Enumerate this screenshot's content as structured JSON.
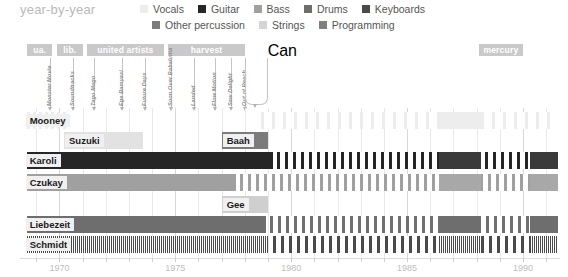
{
  "header": {
    "title": "year-by-year",
    "legend": [
      {
        "label": "Vocals",
        "color": "#ededed"
      },
      {
        "label": "Guitar",
        "color": "#262626"
      },
      {
        "label": "Bass",
        "color": "#a0a0a0"
      },
      {
        "label": "Drums",
        "color": "#6e6e6e"
      },
      {
        "label": "Keyboards",
        "color": "#4a4a4a"
      },
      {
        "label": "Other percussion",
        "color": "#7c7c7c"
      },
      {
        "label": "Strings",
        "color": "#d5d5d5"
      },
      {
        "label": "Programming",
        "color": "#808080"
      }
    ]
  },
  "labels": {
    "bands": [
      {
        "text": "ua.",
        "start": 1968.6,
        "end": 1969.7
      },
      {
        "text": "lib.",
        "start": 1969.9,
        "end": 1971.0
      },
      {
        "text": "united artists",
        "start": 1971.2,
        "end": 1974.5
      },
      {
        "text": "harvest",
        "start": 1974.7,
        "end": 1978.0
      },
      {
        "text": "mercury",
        "start": 1988.1,
        "end": 1990.0
      }
    ]
  },
  "albums": [
    {
      "title": "Monster Movie",
      "year": 1969.6
    },
    {
      "title": "Soundtracks",
      "year": 1970.6
    },
    {
      "title": "Tago Mago",
      "year": 1971.5
    },
    {
      "title": "Ege Bamyasi",
      "year": 1972.7
    },
    {
      "title": "Future Days",
      "year": 1973.7
    },
    {
      "title": "Soon Over Babaluma",
      "year": 1974.8
    },
    {
      "title": "Landed",
      "year": 1975.8
    },
    {
      "title": "Flow Motion",
      "year": 1976.7
    },
    {
      "title": "Saw Delight",
      "year": 1977.4
    },
    {
      "title": "Out of Reach",
      "year": 1978.0
    },
    {
      "title": "Can",
      "year": 1978.9
    }
  ],
  "chart_data": {
    "type": "bar",
    "title": "year-by-year",
    "xlabel": "",
    "ylabel": "",
    "xlim": [
      1968.3,
      1991.6
    ],
    "grid": true,
    "legend_position": "top-right",
    "xticks": [
      1970,
      1975,
      1980,
      1985,
      1990
    ],
    "xticklabels": [
      "1970",
      "1975",
      "1980",
      "1985",
      "1990"
    ],
    "categories": [
      "Mooney",
      "Suzuki",
      "Karoli",
      "Czukay",
      "Baah",
      "Gee",
      "Liebezeit",
      "Schmidt"
    ],
    "rows": [
      {
        "name": "Mooney",
        "label": "Mooney",
        "label_at": 1968.5,
        "label_row": 0,
        "segments": [
          {
            "start": 1968.6,
            "end": 1970.3,
            "color": "#ededed",
            "pattern": "striped",
            "instrument": "Vocals"
          },
          {
            "start": 1978.7,
            "end": 1991.5,
            "color": "#ededed",
            "pattern": "striped-sparse",
            "instrument": "Vocals"
          },
          {
            "start": 1986.4,
            "end": 1988.2,
            "color": "#ededed",
            "pattern": "solid",
            "instrument": "Vocals"
          }
        ]
      },
      {
        "name": "Suzuki",
        "label": "Suzuki",
        "label_at": 1970.2,
        "label_row": 1,
        "segments": [
          {
            "start": 1970.2,
            "end": 1973.6,
            "color": "#e2e2e2",
            "pattern": "solid",
            "instrument": "Vocals"
          }
        ]
      },
      {
        "name": "Baah",
        "label": "Baah",
        "label_at": 1977.0,
        "label_row": 1,
        "segments": [
          {
            "start": 1977.0,
            "end": 1979.0,
            "color": "#7c7c7c",
            "pattern": "solid",
            "instrument": "Other percussion"
          }
        ]
      },
      {
        "name": "Karoli",
        "label": "Karoli",
        "label_at": 1968.5,
        "label_row": 2,
        "segments": [
          {
            "start": 1968.6,
            "end": 1979.2,
            "color": "#262626",
            "pattern": "solid",
            "instrument": "Guitar"
          },
          {
            "start": 1979.4,
            "end": 1991.5,
            "color": "#262626",
            "pattern": "striped-med",
            "instrument": "Guitar"
          },
          {
            "start": 1986.4,
            "end": 1988.2,
            "color": "#3a3a3a",
            "pattern": "solid",
            "instrument": "Guitar"
          },
          {
            "start": 1990.3,
            "end": 1991.5,
            "color": "#3a3a3a",
            "pattern": "solid",
            "instrument": "Guitar"
          }
        ]
      },
      {
        "name": "Czukay",
        "label": "Czukay",
        "label_at": 1968.5,
        "label_row": 3,
        "segments": [
          {
            "start": 1968.6,
            "end": 1977.6,
            "color": "#a0a0a0",
            "pattern": "solid",
            "instrument": "Bass"
          },
          {
            "start": 1977.8,
            "end": 1991.5,
            "color": "#a0a0a0",
            "pattern": "striped-med",
            "instrument": "Bass"
          },
          {
            "start": 1986.4,
            "end": 1988.2,
            "color": "#a8a8a8",
            "pattern": "solid",
            "instrument": "Bass"
          },
          {
            "start": 1990.3,
            "end": 1991.5,
            "color": "#a8a8a8",
            "pattern": "solid",
            "instrument": "Bass"
          }
        ]
      },
      {
        "name": "Gee",
        "label": "Gee",
        "label_at": 1977.0,
        "label_row": 4,
        "segments": [
          {
            "start": 1977.0,
            "end": 1979.0,
            "color": "#cfcfcf",
            "pattern": "solid",
            "instrument": "Strings"
          }
        ]
      },
      {
        "name": "Liebezeit",
        "label": "Liebezeit",
        "label_at": 1968.5,
        "label_row": 5,
        "segments": [
          {
            "start": 1968.6,
            "end": 1978.9,
            "color": "#6e6e6e",
            "pattern": "solid",
            "instrument": "Drums"
          },
          {
            "start": 1979.1,
            "end": 1991.5,
            "color": "#6e6e6e",
            "pattern": "striped-med",
            "instrument": "Drums"
          },
          {
            "start": 1986.4,
            "end": 1988.2,
            "color": "#6e6e6e",
            "pattern": "solid",
            "instrument": "Drums"
          },
          {
            "start": 1990.3,
            "end": 1991.5,
            "color": "#6e6e6e",
            "pattern": "solid",
            "instrument": "Drums"
          }
        ]
      },
      {
        "name": "Schmidt",
        "label": "Schmidt",
        "label_at": 1968.5,
        "label_row": 6,
        "segments": [
          {
            "start": 1968.6,
            "end": 1979.0,
            "color": "#4a4a4a",
            "pattern": "striped-fine",
            "instrument": "Keyboards"
          },
          {
            "start": 1979.2,
            "end": 1991.5,
            "color": "#4a4a4a",
            "pattern": "striped-med",
            "instrument": "Keyboards"
          },
          {
            "start": 1986.4,
            "end": 1988.2,
            "color": "#4a4a4a",
            "pattern": "striped-fine",
            "instrument": "Keyboards"
          },
          {
            "start": 1990.3,
            "end": 1991.5,
            "color": "#4a4a4a",
            "pattern": "striped-fine",
            "instrument": "Keyboards"
          }
        ]
      }
    ]
  }
}
